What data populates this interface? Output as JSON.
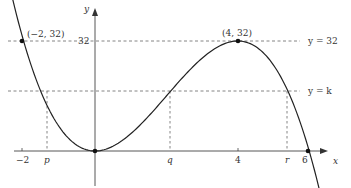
{
  "diagram": {
    "function": "y = x^2(6 - x)",
    "axes": {
      "x_label": "x",
      "y_label": "y"
    },
    "x_ticks": [
      {
        "label": "−2",
        "value": -2,
        "px": 22
      },
      {
        "label": "p",
        "value": "p",
        "px": 47,
        "italic": true
      },
      {
        "label": "q",
        "value": "q",
        "px": 170,
        "italic": true
      },
      {
        "label": "4",
        "value": 4,
        "px": 238
      },
      {
        "label": "r",
        "value": "r",
        "px": 287,
        "italic": true
      },
      {
        "label": "6",
        "value": 6,
        "px": 308
      }
    ],
    "y_ticks": [
      {
        "label": "32",
        "value": 32
      }
    ],
    "points": [
      {
        "label": "(−2, 32)",
        "x": -2,
        "y": 32
      },
      {
        "label": "",
        "x": 0,
        "y": 0
      },
      {
        "label": "(4, 32)",
        "x": 4,
        "y": 32
      },
      {
        "label": "",
        "x": 6,
        "y": 0
      }
    ],
    "lines": [
      {
        "label": "y = 32",
        "y": 32,
        "style": "dashed"
      },
      {
        "label": "y = k",
        "y": "k",
        "style": "dashed"
      }
    ],
    "colors": {
      "curve": "#222222",
      "axis": "#444444",
      "dash": "#666666",
      "text": "#333333"
    }
  }
}
